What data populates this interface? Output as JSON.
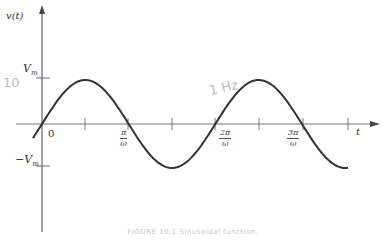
{
  "figure": {
    "caption": "FIGURE 10.1  Sinusoidal function.",
    "y_axis_label": "v(t)",
    "x_axis_label": "t",
    "y_ticks": {
      "positive": "V",
      "positive_sub": "m",
      "negative": "−V",
      "negative_sub": "m"
    },
    "x_ticks": [
      {
        "num": "0",
        "den": ""
      },
      {
        "num": "π",
        "den": "ω"
      },
      {
        "num": "2π",
        "den": "ω"
      },
      {
        "num": "3π",
        "den": "ω"
      }
    ],
    "annotations": {
      "handwritten_amplitude": "10",
      "handwritten_frequency": "1 Hz"
    },
    "colors": {
      "curve": "#333333",
      "axis": "#666666",
      "handwriting": "#bbbbbb"
    }
  }
}
